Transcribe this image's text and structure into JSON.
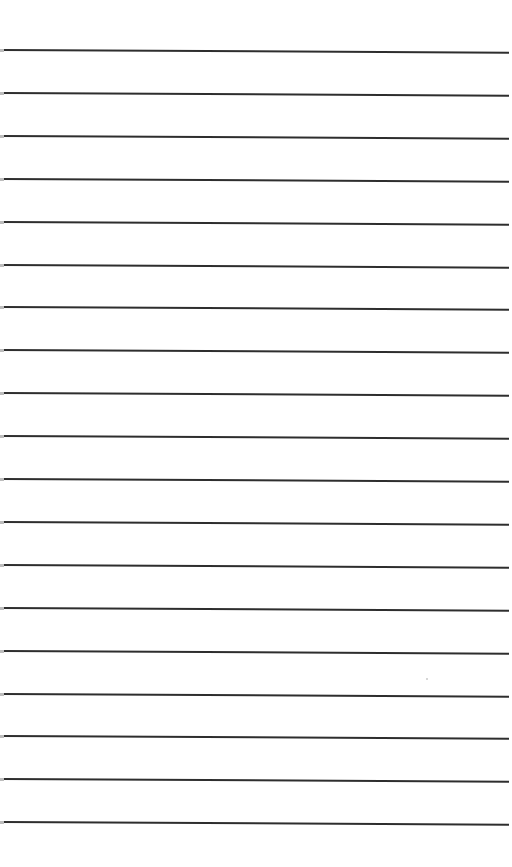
{
  "paper": {
    "background": "#ffffff",
    "line_color": "#2e2e2e",
    "line_count": 19,
    "first_line_y": 49,
    "line_spacing": 42.9,
    "lines": [
      1,
      2,
      3,
      4,
      5,
      6,
      7,
      8,
      9,
      10,
      11,
      12,
      13,
      14,
      15,
      16,
      17,
      18,
      19
    ]
  }
}
